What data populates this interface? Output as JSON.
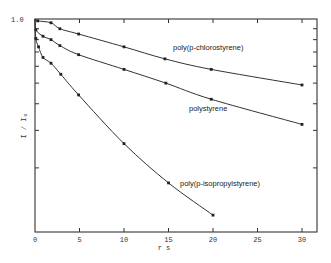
{
  "chart_data": {
    "type": "line",
    "title": "",
    "xlabel": "r s",
    "ylabel": "I / I₀",
    "xlim": [
      0,
      31.8
    ],
    "ylim": [
      0.1,
      1.0
    ],
    "yscale": "log",
    "grid": false,
    "legend": "inline labels next to curves",
    "x_ticks": [
      0,
      5,
      10,
      15,
      20,
      25,
      30
    ],
    "x_tick_labels": [
      "0",
      "5",
      "10",
      "15",
      "20",
      "25",
      "30"
    ],
    "y_ticks": [
      1.0,
      0.9,
      0.8,
      0.7,
      0.6,
      0.5,
      0.4,
      0.3,
      0.2,
      0.1
    ],
    "y_tick_labels": [
      "1.0",
      "",
      "",
      "",
      "",
      "",
      "",
      "",
      "",
      ""
    ],
    "series": [
      {
        "name": "poly(p-chlorostyrene)",
        "x": [
          0,
          0.3,
          1.8,
          2.8,
          4.9,
          10,
          14.6,
          19.8,
          30
        ],
        "values": [
          1.0,
          0.98,
          0.96,
          0.9,
          0.85,
          0.74,
          0.65,
          0.58,
          0.49
        ],
        "label_pos": [
          173,
          50
        ]
      },
      {
        "name": "polystyrene",
        "x": [
          0,
          0.1,
          0.9,
          1.8,
          2.8,
          4.9,
          10,
          14.7,
          19.8,
          30
        ],
        "values": [
          1.0,
          0.89,
          0.83,
          0.8,
          0.75,
          0.68,
          0.58,
          0.5,
          0.42,
          0.32
        ],
        "label_pos": [
          189,
          111
        ]
      },
      {
        "name": "poly(p-isopropylstyrene)",
        "x": [
          0,
          0.1,
          0.4,
          0.9,
          1.8,
          2.9,
          4.9,
          10,
          15,
          20
        ],
        "values": [
          1.0,
          0.81,
          0.74,
          0.66,
          0.62,
          0.55,
          0.44,
          0.26,
          0.17,
          0.12
        ],
        "label_pos": [
          180,
          186
        ]
      }
    ]
  },
  "labels": {
    "y_top": "1.0",
    "x_title": "r s",
    "y_title": "I / I₀"
  }
}
